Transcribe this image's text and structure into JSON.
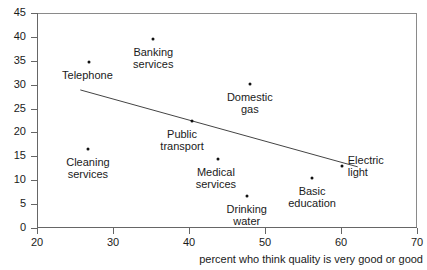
{
  "chart_data": {
    "type": "scatter",
    "title": "",
    "subtitle": "",
    "xlabel": "percent who think quality is very good or good",
    "ylabel": "",
    "xlim": [
      20,
      70
    ],
    "ylim": [
      0,
      45
    ],
    "xticks": [
      20,
      30,
      40,
      50,
      60,
      70
    ],
    "yticks": [
      0,
      5,
      10,
      15,
      20,
      25,
      30,
      35,
      40,
      45
    ],
    "xtick_labels": [
      "20",
      "30",
      "40",
      "50",
      "60",
      "70"
    ],
    "ytick_labels": [
      "0",
      "5",
      "10",
      "15",
      "20",
      "25",
      "30",
      "35",
      "40",
      "45"
    ],
    "grid": false,
    "legend": null,
    "points": [
      {
        "label": "Banking\nservices",
        "x": 35.3,
        "y": 39.6,
        "label_pos": "below",
        "label_align": "center",
        "label_dx": 0,
        "label_dy": 7
      },
      {
        "label": "Telephone",
        "x": 26.9,
        "y": 34.8,
        "label_pos": "below",
        "label_align": "center",
        "label_dx": -2,
        "label_dy": 7
      },
      {
        "label": "Domestic\ngas",
        "x": 48.0,
        "y": 30.1,
        "label_pos": "below",
        "label_align": "center",
        "label_dx": 0,
        "label_dy": 7
      },
      {
        "label": "Public\ntransport",
        "x": 40.4,
        "y": 22.3,
        "label_pos": "below",
        "label_align": "center",
        "label_dx": -10,
        "label_dy": 7
      },
      {
        "label": "Cleaning\nservices",
        "x": 26.7,
        "y": 16.6,
        "label_pos": "below",
        "label_align": "center",
        "label_dx": 0,
        "label_dy": 7
      },
      {
        "label": "Medical\nservices",
        "x": 43.8,
        "y": 14.4,
        "label_pos": "below",
        "label_align": "center",
        "label_dx": -2,
        "label_dy": 7
      },
      {
        "label": "Electric\nlight",
        "x": 60.1,
        "y": 12.9,
        "label_pos": "right",
        "label_align": "left",
        "label_dx": 6,
        "label_dy": -12
      },
      {
        "label": "Basic\neducation",
        "x": 56.2,
        "y": 10.5,
        "label_pos": "below",
        "label_align": "center",
        "label_dx": 0,
        "label_dy": 7
      },
      {
        "label": "Drinking\nwater",
        "x": 47.6,
        "y": 6.7,
        "label_pos": "below",
        "label_align": "center",
        "label_dx": 0,
        "label_dy": 7
      }
    ],
    "trend_line": {
      "x_start": 25.7,
      "y_start": 28.9,
      "x_end": 62.2,
      "y_end": 12.8,
      "color": "#444444",
      "width": 1
    }
  }
}
